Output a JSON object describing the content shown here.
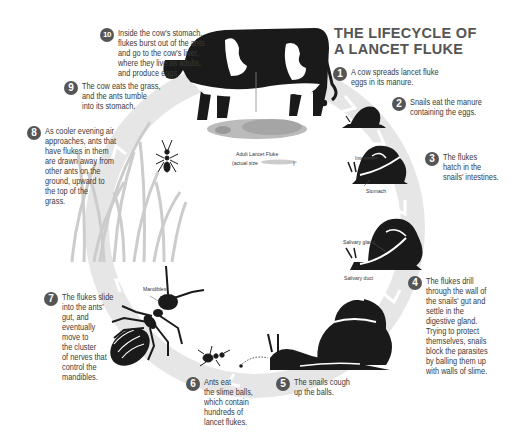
{
  "title": {
    "line1": "THE LIFECYCLE OF",
    "line2": "A LANCET FLUKE"
  },
  "colors": {
    "ink": "#1a1a1a",
    "badge": "#555555",
    "title": "#555555",
    "cycle_ring": "#e6e6e6",
    "grass": "#cfcfcf",
    "fluke": "#b8b8b8"
  },
  "steps": [
    {
      "number": "1",
      "lines": [
        "A cow spreads lancet fluke",
        "eggs in its manure."
      ]
    },
    {
      "number": "2",
      "lines": [
        "Snails eat the manure",
        "containing the eggs."
      ]
    },
    {
      "number": "3",
      "lines": [
        "The flukes",
        "hatch in the",
        "snails' intestines."
      ]
    },
    {
      "number": "4",
      "lines": [
        "The flukes drill",
        "through the wall of",
        "the snails' gut and",
        "settle in the",
        "digestive gland.",
        "Trying to protect",
        "themselves, snails",
        "block the parasites",
        "by balling them up",
        "with walls of slime."
      ]
    },
    {
      "number": "5",
      "lines": [
        "The snails cough",
        "up the balls."
      ]
    },
    {
      "number": "6",
      "lines": [
        "Ants eat",
        "the slime balls,",
        "which contain",
        "hundreds of",
        "lancet flukes."
      ]
    },
    {
      "number": "7",
      "lines": [
        "The flukes slide",
        "into the ants'",
        "gut, and",
        "eventually",
        "move to",
        "the cluster",
        "of nerves that",
        "control the",
        "mandibles."
      ]
    },
    {
      "number": "8",
      "lines": [
        "As cooler evening air",
        "approaches, ants that",
        "have flukes in them",
        "are drawn away from",
        "other ants on the",
        "ground, upward to",
        "the top of the",
        "grass."
      ]
    },
    {
      "number": "9",
      "lines": [
        "The cow eats the grass,",
        "and the ants tumble",
        "into its stomach."
      ]
    },
    {
      "number": "10",
      "lines": [
        "Inside the cow's stomach,",
        "flukes burst out of the ants",
        "and go to the cow's liver,",
        "where they live as adults,",
        "and produce eggs."
      ]
    }
  ],
  "labels": {
    "adult_fluke": "Adult Lancet Fluke",
    "actual_size": "(actual size",
    "actual_size_close": ")",
    "intestine": "Intestine",
    "stomach": "Stomach",
    "salivary_gland": "Salivary gland",
    "salivary_duct": "Salivary duct",
    "mandibles": "Mandibles"
  },
  "icons": {
    "cow": "cow-illustration",
    "eggs": "eggs-cluster",
    "snail_small": "snail-icon",
    "snail_cutaway_1": "snail-intestine-cutaway",
    "snail_cutaway_2": "snail-gland-cutaway",
    "snail_large": "snail-large",
    "ant_small": "ant-icon",
    "ant_large": "ant-large",
    "ant_grass": "ant-on-grass",
    "fluke": "lancet-fluke",
    "grass": "grass-blades"
  }
}
